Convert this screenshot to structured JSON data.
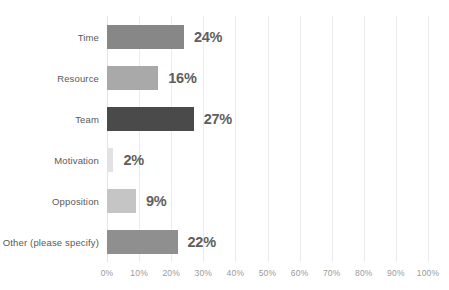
{
  "chart_data": {
    "type": "bar",
    "orientation": "horizontal",
    "title": "",
    "subtitle": "",
    "xlabel": "",
    "ylabel": "",
    "xlim": [
      0,
      100
    ],
    "grid": true,
    "legend": false,
    "categories": [
      "Time",
      "Resource",
      "Team",
      "Motivation",
      "Opposition",
      "Other (please specify)"
    ],
    "values": [
      24,
      16,
      27,
      2,
      9,
      22
    ],
    "value_labels": [
      "24%",
      "16%",
      "27%",
      "2%",
      "9%",
      "22%"
    ],
    "bar_colors": [
      "#878787",
      "#a9a9a9",
      "#4a4a4a",
      "#e2e2e2",
      "#c5c5c5",
      "#8f8f8f"
    ],
    "xticks": [
      0,
      10,
      20,
      30,
      40,
      50,
      60,
      70,
      80,
      90,
      100
    ],
    "xtick_labels": [
      "0%",
      "10%",
      "20%",
      "30%",
      "40%",
      "50%",
      "60%",
      "70%",
      "80%",
      "90%",
      "100%"
    ]
  },
  "style": {
    "background": "#ffffff",
    "gridline_color": "#ececec",
    "category_label_color": "#595959",
    "value_label_color": "#5e5e5e",
    "tick_label_color": "#9a9a9a"
  },
  "title_remnant": ""
}
